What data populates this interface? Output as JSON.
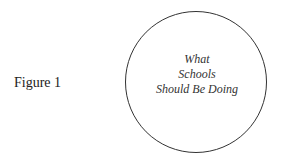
{
  "figure": {
    "label": "Figure 1"
  },
  "diagram": {
    "shape": "circle",
    "stroke_color": "#333333",
    "lines": [
      "What",
      "Schools",
      "Should Be Doing"
    ]
  }
}
